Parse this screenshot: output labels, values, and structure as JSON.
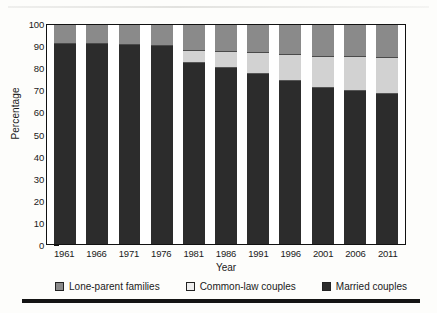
{
  "chart_data": {
    "type": "bar",
    "stacked": true,
    "title": "",
    "xlabel": "Year",
    "ylabel": "Percentage",
    "ylim": [
      0,
      100
    ],
    "yticks": [
      0,
      10,
      20,
      30,
      40,
      50,
      60,
      70,
      80,
      90,
      100
    ],
    "grid": false,
    "legend_position": "bottom",
    "categories": [
      "1961",
      "1966",
      "1971",
      "1976",
      "1981",
      "1986",
      "1991",
      "1996",
      "2001",
      "2006",
      "2011"
    ],
    "series": [
      {
        "name": "Married couples",
        "color": "#2c2c2c",
        "values": [
          91.6,
          91.8,
          91.2,
          91.0,
          83.6,
          80.9,
          78.2,
          75.0,
          71.9,
          70.5,
          69.0
        ]
      },
      {
        "name": "Common-law couples",
        "color": "#d2d2d2",
        "values": [
          0.0,
          0.0,
          0.0,
          0.0,
          5.1,
          7.1,
          9.3,
          11.5,
          13.6,
          15.0,
          16.1
        ]
      },
      {
        "name": "Lone-parent families",
        "color": "#8a8a8a",
        "values": [
          8.4,
          8.2,
          8.8,
          9.0,
          11.3,
          12.0,
          12.5,
          13.5,
          14.5,
          14.5,
          14.9
        ]
      }
    ],
    "segment_tops": {
      "married": [
        91.6,
        91.8,
        91.2,
        91.0,
        83.6,
        80.9,
        78.2,
        75.0,
        71.9,
        70.5,
        69.0
      ],
      "common_law": [
        91.6,
        91.8,
        91.2,
        91.0,
        88.7,
        88.0,
        87.5,
        86.5,
        85.5,
        85.5,
        85.1
      ]
    }
  },
  "legend": {
    "items": [
      {
        "label": "Lone-parent families",
        "swatch": "lone-parent-swatch"
      },
      {
        "label": "Common-law couples",
        "swatch": "common-law-swatch"
      },
      {
        "label": "Married couples",
        "swatch": "married-swatch"
      }
    ]
  }
}
